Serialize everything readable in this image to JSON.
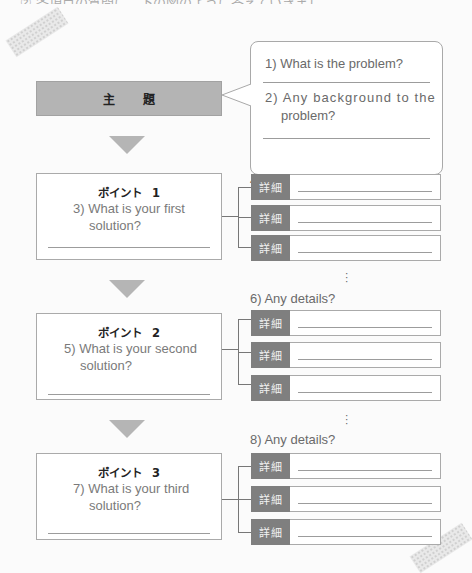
{
  "header_clipped_text": "② 各項目の質問に、下の図のように答えていきましょう。",
  "theme": {
    "label": "主 題"
  },
  "bubble": {
    "question_1": "1) What is the problem?",
    "question_2_line1": "2) Any background to the",
    "question_2_line2": "problem?"
  },
  "points": [
    {
      "title": "ポイント",
      "number": "1",
      "question_line1": "3) What is your first",
      "question_line2": "solution?",
      "details_label": "4) Any details?",
      "details": [
        "詳細",
        "詳細",
        "詳細"
      ]
    },
    {
      "title": "ポイント",
      "number": "2",
      "question_line1": "5) What is your second",
      "question_line2": "solution?",
      "details_label": "6) Any details?",
      "details": [
        "詳細",
        "詳細",
        "詳細"
      ]
    },
    {
      "title": "ポイント",
      "number": "3",
      "question_line1": "7) What is your third",
      "question_line2": "solution?",
      "details_label": "8) Any details?",
      "details": [
        "詳細",
        "詳細",
        "詳細"
      ]
    }
  ],
  "continuation_mark": "⋮",
  "colors": {
    "theme_fill": "#b4b4b4",
    "detail_tag_fill": "#7f7f7f",
    "arrow_fill": "#b5b5b5",
    "border": "#aaaaaa"
  }
}
